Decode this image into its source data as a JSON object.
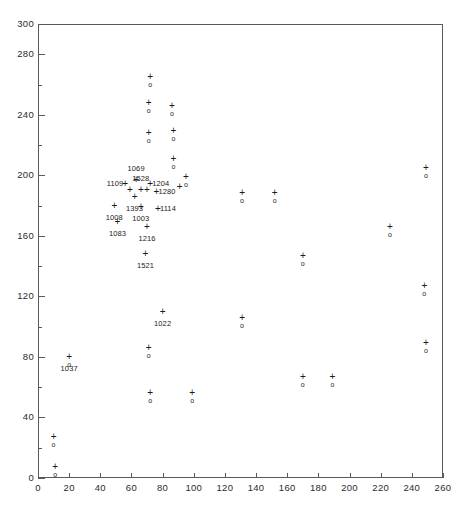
{
  "chart_data": {
    "type": "scatter",
    "title": "",
    "xlabel": "",
    "ylabel": "",
    "xlim": [
      0,
      260
    ],
    "ylim": [
      0,
      300
    ],
    "xticks": [
      0,
      20,
      40,
      60,
      80,
      100,
      120,
      140,
      160,
      180,
      200,
      220,
      240,
      260
    ],
    "yticks": [
      0,
      20,
      40,
      60,
      80,
      100,
      120,
      140,
      160,
      180,
      200,
      220,
      240,
      260,
      280,
      300
    ],
    "grid": false,
    "legend": null,
    "marker_style": "plus-over-circle",
    "series": [
      {
        "name": "observations",
        "marker": "plus-circle",
        "points": [
          {
            "x": 10,
            "y": 27,
            "label": ""
          },
          {
            "x": 11,
            "y": 7,
            "label": ""
          },
          {
            "x": 20,
            "y": 80,
            "label": "1037",
            "label_pos": "below"
          },
          {
            "x": 72,
            "y": 265,
            "label": ""
          },
          {
            "x": 71,
            "y": 248,
            "label": ""
          },
          {
            "x": 86,
            "y": 246,
            "label": ""
          },
          {
            "x": 71,
            "y": 228,
            "label": ""
          },
          {
            "x": 87,
            "y": 229,
            "label": ""
          },
          {
            "x": 87,
            "y": 211,
            "label": ""
          },
          {
            "x": 95,
            "y": 199,
            "label": ""
          },
          {
            "x": 131,
            "y": 188,
            "label": ""
          },
          {
            "x": 152,
            "y": 188,
            "label": ""
          },
          {
            "x": 249,
            "y": 205,
            "label": ""
          },
          {
            "x": 226,
            "y": 166,
            "label": ""
          },
          {
            "x": 170,
            "y": 147,
            "label": ""
          },
          {
            "x": 248,
            "y": 127,
            "label": ""
          },
          {
            "x": 131,
            "y": 106,
            "label": ""
          },
          {
            "x": 71,
            "y": 86,
            "label": ""
          },
          {
            "x": 249,
            "y": 89,
            "label": ""
          },
          {
            "x": 170,
            "y": 67,
            "label": ""
          },
          {
            "x": 189,
            "y": 67,
            "label": ""
          },
          {
            "x": 72,
            "y": 56,
            "label": ""
          },
          {
            "x": 99,
            "y": 56,
            "label": ""
          }
        ]
      },
      {
        "name": "labelled-cluster",
        "marker": "plus",
        "points": [
          {
            "x": 63,
            "y": 197,
            "label": "1069",
            "label_pos": "above"
          },
          {
            "x": 56,
            "y": 194,
            "label": "1109",
            "label_pos": "left"
          },
          {
            "x": 72,
            "y": 194,
            "label": "1204",
            "label_pos": "right"
          },
          {
            "x": 66,
            "y": 190,
            "label": "1528",
            "label_pos": "above"
          },
          {
            "x": 76,
            "y": 189,
            "label": "1280",
            "label_pos": "right"
          },
          {
            "x": 62,
            "y": 186,
            "label": "1393",
            "label_pos": "below"
          },
          {
            "x": 49,
            "y": 180,
            "label": "1008",
            "label_pos": "below"
          },
          {
            "x": 66,
            "y": 179,
            "label": "1003",
            "label_pos": "below"
          },
          {
            "x": 77,
            "y": 178,
            "label": "1114",
            "label_pos": "right"
          },
          {
            "x": 51,
            "y": 169,
            "label": "1083",
            "label_pos": "below"
          },
          {
            "x": 70,
            "y": 166,
            "label": "1216",
            "label_pos": "below"
          },
          {
            "x": 69,
            "y": 148,
            "label": "1521",
            "label_pos": "below"
          },
          {
            "x": 80,
            "y": 110,
            "label": "1022",
            "label_pos": "below"
          }
        ]
      },
      {
        "name": "plus-only-extras",
        "marker": "plus",
        "points": [
          {
            "x": 91,
            "y": 192,
            "label": ""
          },
          {
            "x": 70,
            "y": 190,
            "label": ""
          },
          {
            "x": 59,
            "y": 190,
            "label": ""
          }
        ]
      }
    ]
  },
  "axis": {
    "x_tick_labels": [
      "0",
      "20",
      "40",
      "60",
      "80",
      "100",
      "120",
      "140",
      "160",
      "180",
      "200",
      "220",
      "240",
      "260"
    ],
    "y_tick_labels": [
      "0",
      "20",
      "40",
      "60",
      "80",
      "100",
      "120",
      "140",
      "160",
      "180",
      "200",
      "220",
      "240",
      "260",
      "280",
      "300"
    ]
  },
  "style": {
    "frame_color": "#5a5a5a",
    "marker_color": "#1a1a1a",
    "background": "#ffffff"
  },
  "geometry": {
    "left": 38,
    "right": 443,
    "top": 24,
    "bottom": 478
  }
}
